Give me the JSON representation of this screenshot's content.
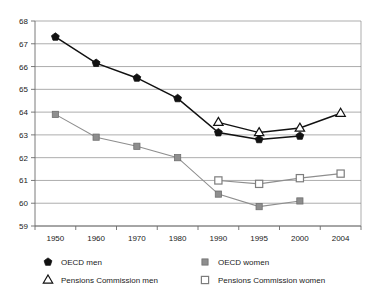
{
  "chart_data": {
    "type": "line",
    "title": "",
    "subtitle": "",
    "xlabel": "",
    "ylabel": "",
    "categories": [
      "1950",
      "1960",
      "1970",
      "1980",
      "1990",
      "1995",
      "2000",
      "2004"
    ],
    "ylim": [
      59,
      68
    ],
    "ytick_labels": [
      "68",
      "67",
      "66",
      "65",
      "64",
      "63",
      "62",
      "61",
      "60",
      "59"
    ],
    "ytick_values": [
      68,
      67,
      66,
      65,
      64,
      63,
      62,
      61,
      60,
      59
    ],
    "grid": true,
    "grid_axis": "y",
    "legend_position": "bottom",
    "series": [
      {
        "name": "OECD men",
        "marker": "filled-pentagon",
        "color": "#111111",
        "x": [
          "1950",
          "1960",
          "1970",
          "1980",
          "1990",
          "1995",
          "2000"
        ],
        "values": [
          67.3,
          66.15,
          65.5,
          64.6,
          63.1,
          62.8,
          62.95
        ]
      },
      {
        "name": "OECD women",
        "marker": "filled-square",
        "color": "#8e8e8e",
        "x": [
          "1950",
          "1960",
          "1970",
          "1980",
          "1990",
          "1995",
          "2000"
        ],
        "values": [
          63.9,
          62.9,
          62.5,
          62.0,
          60.4,
          59.85,
          60.1
        ]
      },
      {
        "name": "Pensions Commission men",
        "marker": "open-triangle",
        "color": "#111111",
        "x": [
          "1990",
          "1995",
          "2000",
          "2004"
        ],
        "values": [
          63.55,
          63.1,
          63.3,
          63.95
        ]
      },
      {
        "name": "Pensions Commission women",
        "marker": "open-square",
        "color": "#7d7d7d",
        "x": [
          "1990",
          "1995",
          "2000",
          "2004"
        ],
        "values": [
          61.0,
          60.85,
          61.1,
          61.3
        ]
      }
    ]
  },
  "legend": {
    "entries": [
      {
        "label": "OECD men",
        "marker": "filled-pentagon"
      },
      {
        "label": "OECD women",
        "marker": "filled-square"
      },
      {
        "label": "Pensions Commission men",
        "marker": "open-triangle"
      },
      {
        "label": "Pensions Commission women",
        "marker": "open-square"
      }
    ]
  }
}
